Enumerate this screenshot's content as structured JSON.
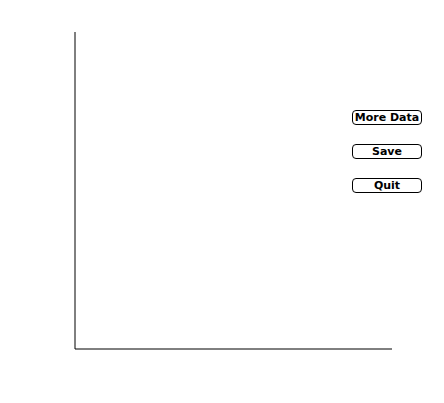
{
  "buttons": {
    "more_data": "More Data",
    "save": "Save",
    "quit": "Quit"
  },
  "chart_data": {
    "type": "scatter",
    "title": "",
    "xlabel": "ln Ryz",
    "ylabel": "ln Rxy",
    "xlim": [
      0,
      3.4
    ],
    "ylim": [
      0,
      3.3
    ],
    "xticks": [
      0,
      0.5,
      1,
      1.5,
      2,
      2.5,
      3
    ],
    "xtick_labels": [
      "0",
      "",
      "1",
      "",
      "2",
      "",
      "3"
    ],
    "yticks": [
      0,
      0.5,
      1,
      1.5,
      2,
      2.5,
      3
    ],
    "ytick_labels": [
      "0",
      "",
      "1",
      "",
      "2",
      "",
      "3"
    ],
    "grid": false,
    "reference_lines": [
      {
        "label": "k = 1",
        "type": "diagonal y=x"
      },
      {
        "label": "k = ∞",
        "type": "vertical x=0"
      },
      {
        "label": "k = 0",
        "type": "horizontal y=0"
      }
    ],
    "points": [
      [
        0.95,
        1.07
      ],
      [
        0.82,
        1.03
      ],
      [
        0.59,
        0.92
      ],
      [
        0.65,
        0.91
      ],
      [
        0.69,
        0.93
      ],
      [
        0.64,
        0.88
      ],
      [
        0.52,
        0.83
      ],
      [
        0.57,
        0.83
      ],
      [
        0.46,
        0.8
      ],
      [
        0.52,
        0.8
      ],
      [
        0.46,
        0.76
      ],
      [
        0.52,
        0.75
      ],
      [
        0.63,
        0.75
      ],
      [
        0.68,
        0.75
      ],
      [
        0.46,
        0.73
      ],
      [
        0.46,
        0.69
      ],
      [
        0.34,
        0.69
      ],
      [
        0.39,
        0.64
      ],
      [
        0.46,
        0.66
      ],
      [
        0.46,
        0.63
      ],
      [
        0.46,
        0.6
      ],
      [
        0.68,
        0.71
      ],
      [
        0.81,
        0.89
      ],
      [
        0.88,
        0.75
      ],
      [
        0.92,
        0.82
      ],
      [
        1.02,
        0.83
      ],
      [
        1.08,
        0.83
      ],
      [
        1.05,
        0.8
      ],
      [
        1.05,
        0.6
      ],
      [
        0.4,
        0.47
      ],
      [
        0.53,
        0.54
      ],
      [
        0.63,
        0.54
      ],
      [
        0.68,
        0.54
      ],
      [
        0.78,
        0.54
      ],
      [
        0.82,
        0.42
      ],
      [
        0.59,
        0.26
      ],
      [
        1.09,
        0.11
      ]
    ]
  }
}
